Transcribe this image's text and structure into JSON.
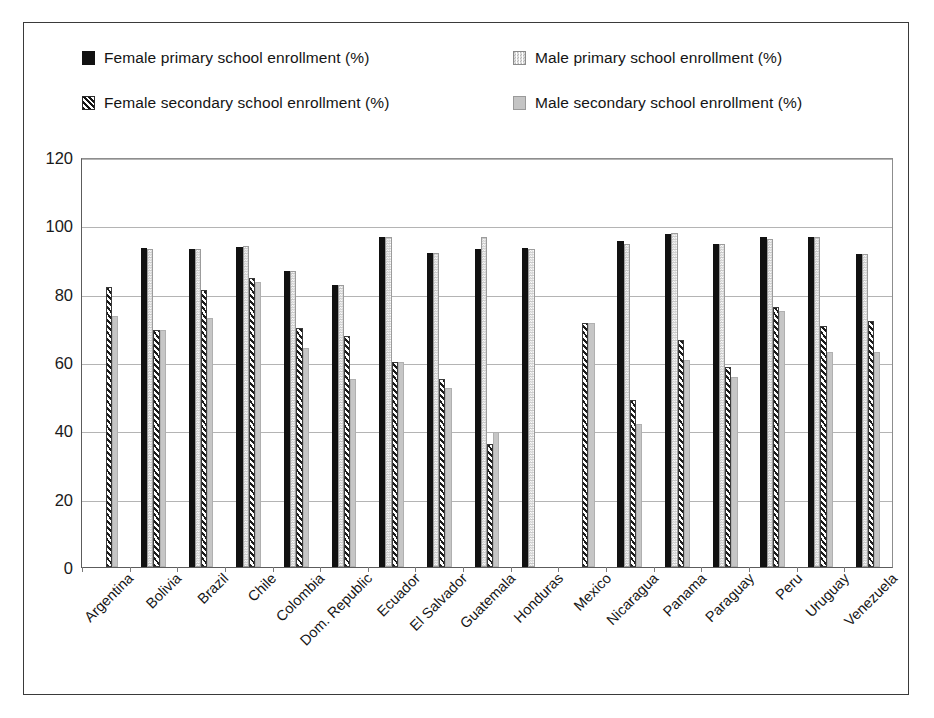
{
  "chart_data": {
    "type": "bar",
    "title": "",
    "subtitle": "",
    "xlabel": "",
    "ylabel": "",
    "ylim": [
      0,
      120
    ],
    "ytick_step": 20,
    "yticks": [
      120,
      100,
      80,
      60,
      40,
      20,
      0
    ],
    "grid": true,
    "legend_position": "top",
    "orientation": "vertical",
    "grouping": "clustered",
    "categories": [
      "Argentina",
      "Bolivia",
      "Brazil",
      "Chile",
      "Colombia",
      "Dom. Republic",
      "Ecuador",
      "El Salvador",
      "Guatemala",
      "Honduras",
      "Mexico",
      "Nicaragua",
      "Panama",
      "Paraguay",
      "Peru",
      "Uruguay",
      "Venezuela"
    ],
    "series": [
      {
        "name": "Female primary school enrollment (%)",
        "key": "female_primary",
        "pattern": "solid-black",
        "color": "#111111",
        "values": [
          null,
          93.5,
          93.0,
          93.8,
          86.5,
          82.5,
          96.5,
          91.8,
          93.0,
          93.5,
          null,
          95.5,
          97.5,
          94.5,
          96.5,
          96.5,
          91.5
        ]
      },
      {
        "name": "Male primary school enrollment (%)",
        "key": "male_primary",
        "pattern": "dotted-light",
        "color": "#c6c6c6",
        "values": [
          null,
          93.0,
          93.0,
          94.0,
          86.5,
          82.5,
          96.5,
          91.8,
          96.5,
          93.0,
          null,
          94.5,
          97.8,
          94.5,
          96.0,
          96.5,
          91.5
        ]
      },
      {
        "name": "Female secondary school enrollment (%)",
        "key": "female_secondary",
        "pattern": "diagonal-hatch",
        "color": "#1b1b1b",
        "values": [
          82.0,
          69.5,
          81.0,
          84.5,
          70.0,
          67.5,
          60.0,
          55.0,
          36.0,
          null,
          71.5,
          49.0,
          66.5,
          58.5,
          76.0,
          70.5,
          72.0
        ]
      },
      {
        "name": "Male secondary school enrollment (%)",
        "key": "male_secondary",
        "pattern": "solid-gray",
        "color": "#c6c6c6",
        "values": [
          73.5,
          69.5,
          73.0,
          83.5,
          64.0,
          55.0,
          60.0,
          52.5,
          39.5,
          null,
          71.5,
          42.0,
          60.5,
          55.5,
          75.0,
          63.0,
          63.0
        ]
      }
    ]
  },
  "legend": {
    "items": [
      {
        "label": "Female primary school enrollment (%)",
        "swatch": "solid-black-swatch"
      },
      {
        "label": "Male primary school enrollment (%)",
        "swatch": "dotted-light-swatch"
      },
      {
        "label": "Female secondary school enrollment (%)",
        "swatch": "diagonal-hatch-swatch"
      },
      {
        "label": "Male secondary school enrollment (%)",
        "swatch": "solid-gray-swatch"
      }
    ]
  },
  "colors": {
    "frame": "#3a3a3a",
    "axis": "#5c5c5c",
    "grid": "#b4b4b4",
    "background": "#ffffff",
    "series_primary_female": "#111111",
    "series_primary_male": "#c6c6c6",
    "series_secondary_female": "#1b1b1b",
    "series_secondary_male": "#c6c6c6"
  }
}
